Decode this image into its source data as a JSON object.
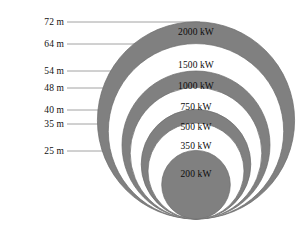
{
  "figure": {
    "baseline_y": 219,
    "center_x": 196,
    "px_per_meter": 2.74,
    "colors": {
      "band_gray": "#808080",
      "band_white": "#ffffff",
      "outline": "#6b6b6b",
      "leader_line": "#8a8a8a",
      "text": "#111111",
      "background": "#ffffff"
    }
  },
  "chart_data": {
    "type": "bar",
    "xlabel": "",
    "ylabel": "Rotor diameter (m)",
    "categories": [
      "200 kW",
      "350 kW",
      "500 kW",
      "750 kW",
      "1000 kW",
      "1500 kW",
      "2000 kW"
    ],
    "values": [
      25,
      35,
      40,
      48,
      54,
      64,
      72
    ],
    "series": [
      {
        "name": "Rotor diameter (m)",
        "values": [
          25,
          35,
          40,
          48,
          54,
          64,
          72
        ]
      },
      {
        "name": "Rated power (kW)",
        "values": [
          200,
          350,
          500,
          750,
          1000,
          1500,
          2000
        ]
      }
    ],
    "ylim": [
      0,
      72
    ],
    "grid": false,
    "legend": "none",
    "note": "Nested circles tangent at a common baseline; circle diameter encodes rotor diameter in metres, each annotated with its rated power."
  },
  "circles": [
    {
      "id": "c-2000",
      "diameter_m": 72,
      "power_label": "2000 kW",
      "meter_label": "72 m",
      "fill": "#808080",
      "radius_px": 98.6,
      "label_y": 32,
      "leader_y": 22,
      "label_left_right_edge": 64
    },
    {
      "id": "c-1500",
      "diameter_m": 64,
      "power_label": "1500 kW",
      "meter_label": "64 m",
      "fill": "#ffffff",
      "radius_px": 87.7,
      "label_y": 65,
      "leader_y": 44,
      "label_left_right_edge": 64
    },
    {
      "id": "c-1000",
      "diameter_m": 54,
      "power_label": "1000 kW",
      "meter_label": "54 m",
      "fill": "#808080",
      "radius_px": 74.0,
      "label_y": 86,
      "leader_y": 71,
      "label_left_right_edge": 64
    },
    {
      "id": "c-750",
      "diameter_m": 48,
      "power_label": "750 kW",
      "meter_label": "48 m",
      "fill": "#ffffff",
      "radius_px": 65.8,
      "label_y": 107,
      "leader_y": 88,
      "label_left_right_edge": 64
    },
    {
      "id": "c-500",
      "diameter_m": 40,
      "power_label": "500 kW",
      "meter_label": "40 m",
      "fill": "#808080",
      "radius_px": 54.8,
      "label_y": 127,
      "leader_y": 110,
      "label_left_right_edge": 64
    },
    {
      "id": "c-350",
      "diameter_m": 35,
      "power_label": "350 kW",
      "meter_label": "35 m",
      "fill": "#ffffff",
      "radius_px": 48.0,
      "label_y": 146,
      "leader_y": 124,
      "label_left_right_edge": 64
    },
    {
      "id": "c-200",
      "diameter_m": 25,
      "power_label": "200 kW",
      "meter_label": "25 m",
      "fill": "#808080",
      "radius_px": 34.3,
      "label_y": 174,
      "leader_y": 151,
      "label_left_right_edge": 64
    }
  ]
}
